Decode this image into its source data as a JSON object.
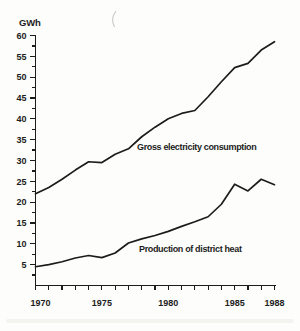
{
  "page": {
    "background": "#fdfdfb",
    "ink": "#1c1c1c"
  },
  "chart_data": {
    "type": "line",
    "title": "",
    "xlabel": "",
    "ylabel": "GWh",
    "grid": false,
    "legend_position": "inline",
    "ylim": [
      0,
      60
    ],
    "y_tick_step": 5,
    "y_minor_tick_step": 2.5,
    "x": [
      1970,
      1971,
      1972,
      1973,
      1974,
      1975,
      1976,
      1977,
      1978,
      1979,
      1980,
      1981,
      1982,
      1983,
      1984,
      1985,
      1986,
      1987,
      1988
    ],
    "x_tick_labels": [
      "1970",
      "1975",
      "1980",
      "1985",
      "1988"
    ],
    "series": [
      {
        "name": "Gross electricity consumption",
        "values": [
          22,
          23.5,
          25.5,
          27.7,
          29.7,
          29.5,
          31.5,
          32.8,
          35.7,
          38,
          40,
          41.3,
          42,
          45.3,
          48.9,
          52.3,
          53.3,
          56.5,
          58.5
        ]
      },
      {
        "name": "Production of district heat",
        "values": [
          4.5,
          5,
          5.7,
          6.6,
          7.2,
          6.7,
          7.8,
          10.2,
          11.2,
          12,
          13,
          14.2,
          15.3,
          16.5,
          19.5,
          24.3,
          22.7,
          25.5,
          24.2
        ]
      }
    ]
  }
}
